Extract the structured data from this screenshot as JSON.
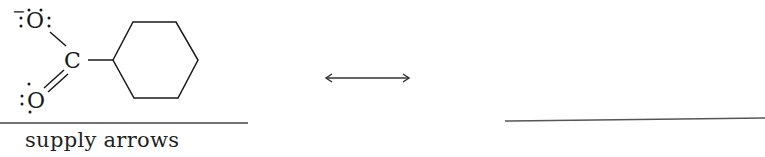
{
  "structure": {
    "name": "cyclohexanecarboxylate",
    "atoms": {
      "top_oxygen": "O",
      "carbon": "C",
      "bottom_oxygen": "O"
    },
    "top_oxygen_charge": "−",
    "ring": "cyclohexane"
  },
  "resonance_arrow": {
    "symbol": "double-headed-arrow"
  },
  "answer_blank": {
    "value": ""
  },
  "caption": {
    "text": "supply arrows"
  },
  "colors": {
    "ink": "#1a1a1a",
    "rule": "#444444",
    "background": "#ffffff"
  }
}
